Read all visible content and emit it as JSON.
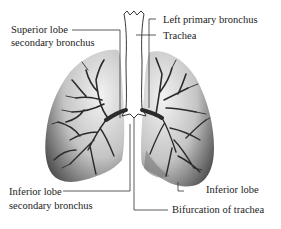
{
  "diagram": {
    "labels": {
      "superior_lobe_line1": "Superior lobe",
      "superior_lobe_line2": "secondary bronchus",
      "left_primary_bronchus": "Left  primary  bronchus",
      "trachea": "Trachea",
      "inferior_lobe_sec_line1": "Inferior lobe",
      "inferior_lobe_sec_line2": "secondary bronchus",
      "inferior_lobe": "Inferior  lobe",
      "bifurcation": "Bifurcation of trachea"
    },
    "colors": {
      "lung_light": "#e6e6e6",
      "lung_dark": "#5a5a5a",
      "bronchi": "#2b2b2b",
      "leader_line": "#333333",
      "text": "#222222"
    }
  }
}
